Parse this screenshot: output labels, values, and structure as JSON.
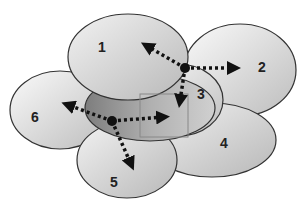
{
  "diagram": {
    "title": "",
    "cells": [
      {
        "id": "1",
        "label": "1",
        "cx": 128,
        "cy": 57,
        "rx": 60,
        "ry": 43
      },
      {
        "id": "2",
        "label": "2",
        "cx": 240,
        "cy": 70,
        "rx": 56,
        "ry": 46
      },
      {
        "id": "3",
        "label": "3",
        "cx": 178,
        "cy": 100,
        "rx": 45,
        "ry": 36
      },
      {
        "id": "4",
        "label": "4",
        "cx": 212,
        "cy": 140,
        "rx": 64,
        "ry": 37
      },
      {
        "id": "5",
        "label": "5",
        "cx": 127,
        "cy": 160,
        "rx": 50,
        "ry": 38
      },
      {
        "id": "6",
        "label": "6",
        "cx": 60,
        "cy": 110,
        "rx": 50,
        "ry": 39
      },
      {
        "id": "center",
        "label": "",
        "cx": 150,
        "cy": 108,
        "rx": 65,
        "ry": 33
      }
    ],
    "nodes": [
      {
        "id": "node-a",
        "x": 185,
        "y": 68
      },
      {
        "id": "node-b",
        "x": 112,
        "y": 121
      }
    ],
    "arrows": [
      {
        "from": "node-a",
        "to": "cell-1",
        "x2": 145,
        "y2": 45
      },
      {
        "from": "node-a",
        "to": "cell-2",
        "x2": 238,
        "y2": 68
      },
      {
        "from": "node-a",
        "to": "cell-3",
        "x2": 178,
        "y2": 103
      },
      {
        "from": "node-b",
        "to": "cell-6",
        "x2": 66,
        "y2": 104
      },
      {
        "from": "node-b",
        "to": "cell-3",
        "x2": 166,
        "y2": 117
      },
      {
        "from": "node-b",
        "to": "cell-5",
        "x2": 132,
        "y2": 166
      }
    ],
    "highlight_box": {
      "x": 140,
      "y": 94,
      "w": 48,
      "h": 43
    },
    "colors": {
      "stroke": "#333333",
      "cell_fill": "#d8d8d8",
      "center_fill": "#9a9a9a",
      "arrow": "#111111",
      "box": "#888888"
    }
  }
}
